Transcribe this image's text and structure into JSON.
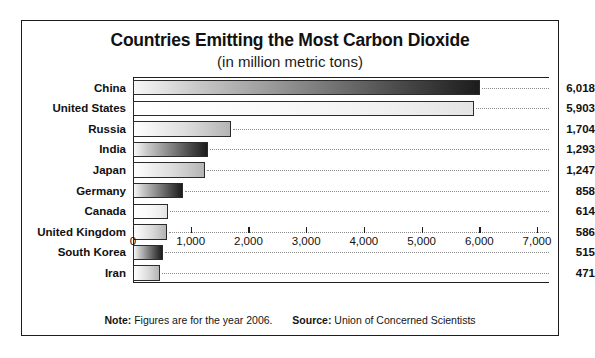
{
  "chart_data": {
    "type": "bar",
    "orientation": "horizontal",
    "title": "Countries Emitting the Most Carbon Dioxide",
    "subtitle": "(in million metric tons)",
    "xlabel": "",
    "ylabel": "",
    "xlim": [
      0,
      7000
    ],
    "xticks": [
      "0",
      "1,000",
      "2,000",
      "3,000",
      "4,000",
      "5,000",
      "6,000",
      "7,000"
    ],
    "xtick_values": [
      0,
      1000,
      2000,
      3000,
      4000,
      5000,
      6000,
      7000
    ],
    "grid": "dotted-leader-lines",
    "legend": "none",
    "categories": [
      "China",
      "United States",
      "Russia",
      "India",
      "Japan",
      "Germany",
      "Canada",
      "United Kingdom",
      "South Korea",
      "Iran"
    ],
    "values": [
      6018,
      5903,
      1704,
      1293,
      1247,
      858,
      614,
      586,
      515,
      471
    ],
    "value_labels": [
      "6,018",
      "5,903",
      "1,704",
      "1,293",
      "1,247",
      "858",
      "614",
      "586",
      "515",
      "471"
    ],
    "bar_styles": [
      "dark",
      "vlight",
      "light",
      "dark",
      "light",
      "dark",
      "vlight",
      "light",
      "dark",
      "light"
    ],
    "note_label": "Note:",
    "note_text": "Figures are for the year 2006.",
    "source_label": "Source:",
    "source_text": "Union of Concerned Scientists"
  },
  "colors": {
    "border": "#1c1c1c",
    "text": "#111111",
    "gridline": "#8a8a8a",
    "background": "#ffffff"
  }
}
